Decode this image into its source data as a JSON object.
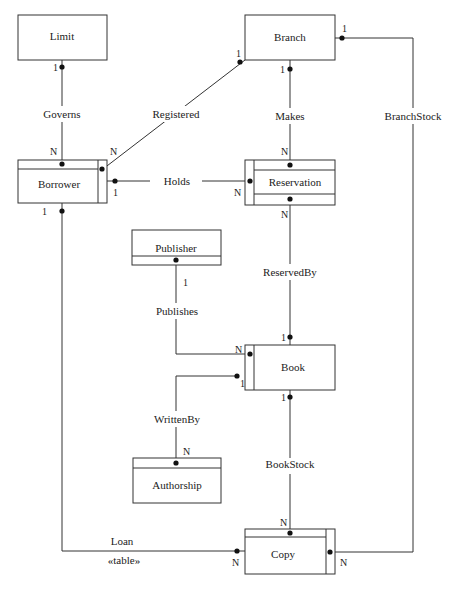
{
  "diagram": {
    "type": "entity-relationship",
    "entities": {
      "limit": {
        "label": "Limit"
      },
      "branch": {
        "label": "Branch"
      },
      "borrower": {
        "label": "Borrower"
      },
      "reservation": {
        "label": "Reservation"
      },
      "publisher": {
        "label": "Publisher"
      },
      "book": {
        "label": "Book"
      },
      "authorship": {
        "label": "Authorship"
      },
      "copy": {
        "label": "Copy"
      }
    },
    "relationships": {
      "governs": {
        "label": "Governs",
        "from": "Limit",
        "to": "Borrower",
        "from_card": "1",
        "to_card": "N"
      },
      "registered": {
        "label": "Registered",
        "from": "Branch",
        "to": "Borrower",
        "from_card": "1",
        "to_card": "N"
      },
      "makes": {
        "label": "Makes",
        "from": "Branch",
        "to": "Reservation",
        "from_card": "1",
        "to_card": "N"
      },
      "branchstock": {
        "label": "BranchStock",
        "from": "Branch",
        "to": "Copy",
        "from_card": "1",
        "to_card": "N"
      },
      "holds": {
        "label": "Holds",
        "from": "Borrower",
        "to": "Reservation",
        "from_card": "1",
        "to_card": "N"
      },
      "reservedby": {
        "label": "ReservedBy",
        "from": "Book",
        "to": "Reservation",
        "from_card": "1",
        "to_card": "N"
      },
      "publishes": {
        "label": "Publishes",
        "from": "Publisher",
        "to": "Book",
        "from_card": "1",
        "to_card": "N"
      },
      "writtenby": {
        "label": "WrittenBy",
        "from": "Book",
        "to": "Authorship",
        "from_card": "1",
        "to_card": "N"
      },
      "bookstock": {
        "label": "BookStock",
        "from": "Book",
        "to": "Copy",
        "from_card": "1",
        "to_card": "N"
      },
      "loan": {
        "label": "Loan",
        "stereotype": "«table»",
        "from": "Borrower",
        "to": "Copy",
        "from_card": "1",
        "to_card": "N"
      }
    }
  }
}
